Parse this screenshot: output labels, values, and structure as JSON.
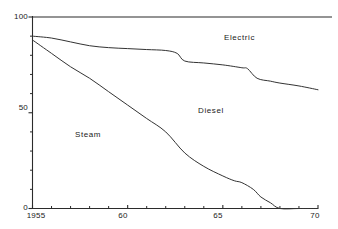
{
  "chart_data": {
    "type": "area",
    "title": "",
    "subtitle": "",
    "xlabel": "",
    "ylabel": "",
    "xlim": [
      1955,
      1970
    ],
    "ylim": [
      0,
      100
    ],
    "grid": false,
    "legend_position": "inline-annotations",
    "y_tick_labels": [
      "100",
      "50",
      "0"
    ],
    "y_tick_values": [
      100,
      50,
      0
    ],
    "y_minor_tick_values": [
      10,
      20,
      30,
      40,
      60,
      70,
      80,
      90
    ],
    "x_tick_labels": [
      "1955",
      "60",
      "65",
      "70"
    ],
    "x_tick_values": [
      1955,
      1960,
      1965,
      1970
    ],
    "x_minor_tick_values": [
      1956,
      1957,
      1958,
      1959,
      1961,
      1962,
      1963,
      1964,
      1966,
      1967,
      1968,
      1969
    ],
    "annotations": [
      {
        "text": "Electric",
        "x": 1967.3,
        "y": 79
      },
      {
        "text": "Diesel",
        "x": 1964.6,
        "y": 41
      },
      {
        "text": "Steam",
        "x": 1958.3,
        "y": 28
      }
    ],
    "series": [
      {
        "name": "Electric boundary",
        "description": "Upper curve: cumulative share below which is diesel plus steam",
        "x": [
          1955,
          1956,
          1957,
          1958,
          1959,
          1960,
          1961,
          1962,
          1962.6,
          1963,
          1964,
          1965,
          1966,
          1966.3,
          1966.8,
          1967.5,
          1968,
          1969,
          1970
        ],
        "values": [
          90,
          89,
          87,
          85,
          84,
          83.5,
          83,
          82.5,
          81,
          77,
          76,
          75,
          73.5,
          73,
          68,
          66.5,
          65.5,
          64,
          62
        ]
      },
      {
        "name": "Steam boundary",
        "description": "Lower curve: share of steam traction",
        "x": [
          1955,
          1956,
          1957,
          1958,
          1959,
          1960,
          1961,
          1962,
          1963,
          1964,
          1965,
          1965.6,
          1966,
          1966.6,
          1967,
          1967.5,
          1968,
          1969,
          1970
        ],
        "values": [
          88,
          81,
          74,
          68,
          61,
          54,
          47,
          40,
          29,
          22,
          17,
          14.5,
          13.5,
          10,
          6,
          3,
          0,
          0,
          0
        ]
      }
    ],
    "bands": [
      {
        "name": "Steam",
        "label": "Steam"
      },
      {
        "name": "Diesel",
        "label": "Diesel"
      },
      {
        "name": "Electric",
        "label": "Electric"
      }
    ],
    "line_color": "#333333",
    "axis_color": "#2b2b2b",
    "background_color": "#ffffff"
  }
}
